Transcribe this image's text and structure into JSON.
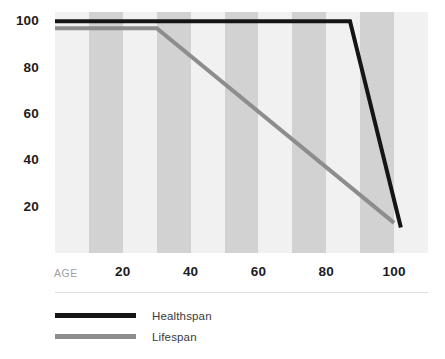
{
  "chart_data": {
    "type": "line",
    "title": "",
    "subtitle": "",
    "xlabel": "AGE",
    "ylabel": "",
    "xlim": [
      0,
      110
    ],
    "ylim": [
      0,
      104
    ],
    "grid": false,
    "legend_position": "bottom-left",
    "x_tick_labels": [
      "20",
      "40",
      "60",
      "80",
      "100"
    ],
    "x_tick_values": [
      20,
      40,
      60,
      80,
      100
    ],
    "y_tick_labels": [
      "100",
      "80",
      "60",
      "40",
      "20"
    ],
    "y_tick_values": [
      100,
      80,
      60,
      40,
      20
    ],
    "background_bands": {
      "description": "alternating vertical shaded bands every 10 age units",
      "light_color": "#f1f1f1",
      "dark_color": "#d2d2d2",
      "band_width_units": 10,
      "start_unit": 0
    },
    "series": [
      {
        "name": "Healthspan",
        "color": "#151515",
        "line_width": 4,
        "x": [
          0,
          87,
          102
        ],
        "values": [
          100,
          100,
          11
        ]
      },
      {
        "name": "Lifespan",
        "color": "#8d8d8d",
        "line_width": 4,
        "x": [
          0,
          30,
          100
        ],
        "values": [
          97,
          97,
          13
        ]
      }
    ]
  },
  "axes": {
    "x_axis_name": "AGE",
    "x_ticks": [
      {
        "label": "20",
        "value": 20
      },
      {
        "label": "40",
        "value": 40
      },
      {
        "label": "60",
        "value": 60
      },
      {
        "label": "80",
        "value": 80
      },
      {
        "label": "100",
        "value": 100
      }
    ],
    "y_ticks": [
      {
        "label": "100",
        "value": 100
      },
      {
        "label": "80",
        "value": 80
      },
      {
        "label": "60",
        "value": 60
      },
      {
        "label": "40",
        "value": 40
      },
      {
        "label": "20",
        "value": 20
      }
    ]
  },
  "legend": {
    "items": [
      {
        "label": "Healthspan",
        "color": "#151515"
      },
      {
        "label": "Lifespan",
        "color": "#8d8d8d"
      }
    ]
  },
  "colors": {
    "healthspan": "#151515",
    "lifespan": "#8d8d8d",
    "band_light": "#f1f1f1",
    "band_dark": "#d2d2d2",
    "tick_text": "#1c1c1c",
    "axis_name_text": "#a0a0a0",
    "divider": "#dddddd",
    "legend_text": "#3a3a3a"
  }
}
